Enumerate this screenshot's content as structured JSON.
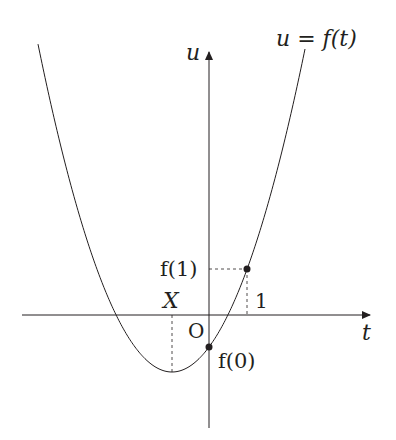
{
  "diagram": {
    "type": "function-graph",
    "curve_label": "u = f(t)",
    "axes": {
      "horizontal_label": "t",
      "vertical_label": "u",
      "origin_label": "O"
    },
    "points": [
      {
        "name": "f(0)",
        "label": "f(0)",
        "desc": "u-intercept"
      },
      {
        "name": "f(1)",
        "label": "f(1)",
        "desc": "value at t = 1"
      }
    ],
    "tick_labels": {
      "t_one": "1",
      "vertex_t": "X",
      "f_one": "f(1)",
      "f_zero": "f(0)"
    },
    "colors": {
      "line": "#231f20",
      "background": "#ffffff"
    }
  }
}
